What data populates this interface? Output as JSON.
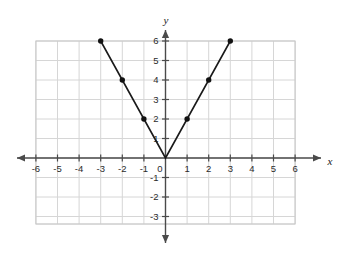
{
  "chart_data": {
    "type": "line",
    "title": "",
    "subtitle": "",
    "xlabel": "x",
    "ylabel": "y",
    "xlim": [
      -6,
      6
    ],
    "ylim": [
      -3,
      6
    ],
    "grid": true,
    "legend": "none",
    "x_ticks": [
      "-6",
      "-5",
      "-4",
      "-3",
      "-2",
      "-1",
      "0",
      "1",
      "2",
      "3",
      "4",
      "5",
      "6"
    ],
    "x_tick_values": [
      -6,
      -5,
      -4,
      -3,
      -2,
      -1,
      0,
      1,
      2,
      3,
      4,
      5,
      6
    ],
    "y_ticks": [
      "6",
      "5",
      "4",
      "3",
      "2",
      "1",
      "-1",
      "-2",
      "-3"
    ],
    "y_tick_values": [
      6,
      5,
      4,
      3,
      2,
      1,
      -1,
      -2,
      -3
    ],
    "origin_label": "0",
    "series": [
      {
        "name": "y = 2|x|",
        "x": [
          -3,
          -2,
          -1,
          0,
          1,
          2,
          3
        ],
        "values": [
          6,
          4,
          2,
          0,
          2,
          4,
          6
        ],
        "marker": "filled-circle",
        "line_color": "#1a1a1a",
        "marker_color": "#111111"
      }
    ],
    "annotations": []
  },
  "style": {
    "background": "#ffffff",
    "grid_color": "#d6d6d6",
    "grid_border_color": "#c8c8c8",
    "axis_color": "#4a4a4a",
    "curve_color": "#1a1a1a",
    "point_color": "#111111",
    "tick_text_color": "#2b2b2b",
    "axis_label_color": "#1a1a1a"
  },
  "icons": {
    "x_axis_arrow_left": "arrow-left-icon",
    "x_axis_arrow_right": "arrow-right-icon",
    "y_axis_arrow_up": "arrow-up-icon",
    "y_axis_arrow_down": "arrow-down-icon"
  }
}
